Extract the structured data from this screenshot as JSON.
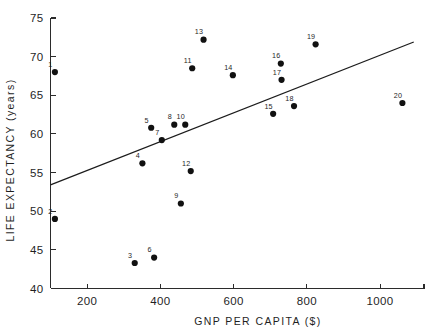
{
  "chart_data": {
    "type": "scatter",
    "title": "",
    "xlabel": "GNP PER CAPITA ($)",
    "ylabel": "LIFE EXPECTANCY (years)",
    "xlim": [
      100,
      1120
    ],
    "ylim": [
      40,
      75
    ],
    "xticks": [
      200,
      400,
      600,
      800,
      1000
    ],
    "xtick_labels": [
      "200",
      "400",
      "600",
      "800",
      "1000"
    ],
    "yticks": [
      40,
      45,
      50,
      55,
      60,
      65,
      70,
      75
    ],
    "ytick_labels": [
      "40",
      "45",
      "50",
      "55",
      "60",
      "65",
      "70",
      "75"
    ],
    "grid": false,
    "legend": "none",
    "point_label_position": "above-left",
    "points": [
      {
        "label": "1",
        "x": 112,
        "y": 68.0
      },
      {
        "label": "2",
        "x": 112,
        "y": 49.0
      },
      {
        "label": "3",
        "x": 330,
        "y": 43.3
      },
      {
        "label": "4",
        "x": 351,
        "y": 56.2
      },
      {
        "label": "5",
        "x": 375,
        "y": 60.8
      },
      {
        "label": "6",
        "x": 383,
        "y": 44.0
      },
      {
        "label": "7",
        "x": 404,
        "y": 59.2
      },
      {
        "label": "8",
        "x": 438,
        "y": 61.2
      },
      {
        "label": "9",
        "x": 456,
        "y": 51.0
      },
      {
        "label": "10",
        "x": 468,
        "y": 61.2
      },
      {
        "label": "11",
        "x": 487,
        "y": 68.5
      },
      {
        "label": "12",
        "x": 483,
        "y": 55.2
      },
      {
        "label": "13",
        "x": 518,
        "y": 72.2
      },
      {
        "label": "14",
        "x": 598,
        "y": 67.6
      },
      {
        "label": "15",
        "x": 708,
        "y": 62.6
      },
      {
        "label": "16",
        "x": 729,
        "y": 69.1
      },
      {
        "label": "17",
        "x": 731,
        "y": 67.0
      },
      {
        "label": "18",
        "x": 765,
        "y": 63.6
      },
      {
        "label": "19",
        "x": 824,
        "y": 71.6
      },
      {
        "label": "20",
        "x": 1061,
        "y": 64.0
      }
    ],
    "fit_line": {
      "name": "regression line",
      "x_start": 100,
      "y_start": 53.4,
      "x_end": 1092,
      "y_end": 71.9
    }
  },
  "colors": {
    "background": "#ffffff",
    "axis": "#2b2b2b",
    "point": "#111111",
    "line": "#1c1c1c",
    "text": "#1f1f1f"
  }
}
